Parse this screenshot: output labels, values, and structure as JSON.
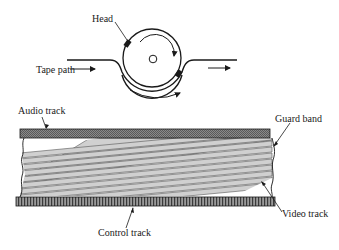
{
  "diagram": {
    "drum": {
      "labels": {
        "head": "Head",
        "tape_path": "Tape path"
      },
      "rotation": "clockwise",
      "tape_direction": "left-to-right"
    },
    "tape": {
      "labels": {
        "audio_track": "Audio track",
        "guard_band": "Guard band",
        "video_track": "Video track",
        "control_track": "Control track"
      },
      "video_track_count": 14
    },
    "colors": {
      "ink": "#1a1a1a",
      "audio_fill": "#7a7a7a",
      "control_fill": "#6a6a6a",
      "video_stripe": "#c8c8c8",
      "background": "#ffffff"
    }
  }
}
